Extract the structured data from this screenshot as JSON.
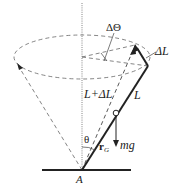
{
  "diagram": {
    "labels": {
      "delta_theta": "ΔΘ",
      "delta_L": "ΔL",
      "L_plus_delta_L": "L+ΔL",
      "L": "L",
      "theta": "θ",
      "r_G": "r",
      "r_G_sub": "G",
      "mg": "mg",
      "pivot": "A"
    },
    "colors": {
      "line": "#222222",
      "dashed": "#555555",
      "background": "#ffffff"
    }
  }
}
